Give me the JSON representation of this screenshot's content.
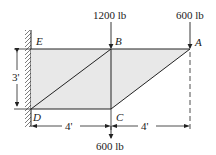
{
  "diagram": {
    "type": "truss",
    "nodes": {
      "A": {
        "label": "A"
      },
      "B": {
        "label": "B"
      },
      "C": {
        "label": "C"
      },
      "D": {
        "label": "D"
      },
      "E": {
        "label": "E"
      }
    },
    "members": [
      "EB",
      "BA",
      "DC",
      "DB",
      "CA",
      "BC"
    ],
    "support": "wall at D and E (left)",
    "loads": {
      "B": "1200 lb",
      "A": "600 lb",
      "C": "600 lb"
    },
    "dimensions": {
      "height": "3'",
      "span_DC": "4'",
      "span_CA": "4'"
    },
    "colors": {
      "fill": "#e8e8e8",
      "line": "#222222"
    }
  }
}
